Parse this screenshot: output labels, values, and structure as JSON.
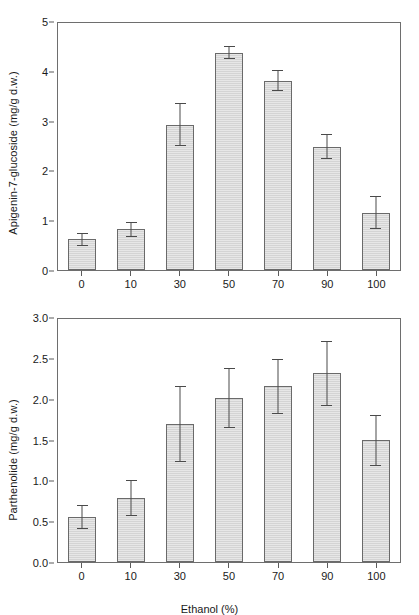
{
  "figure": {
    "background": "#ffffff",
    "bar_fill": "#d4d4d4",
    "bar_edge": "#6a6a6a",
    "axis_color": "#6e6e6e",
    "error_color": "#4a4a4a"
  },
  "chart_data": [
    {
      "type": "bar",
      "panel": "top",
      "title": "",
      "xlabel": "",
      "ylabel": "Apigenin-7-glucoside (mg/g d.w.)",
      "categories": [
        "0",
        "10",
        "30",
        "50",
        "70",
        "90",
        "100"
      ],
      "values": [
        0.62,
        0.82,
        2.92,
        4.36,
        3.8,
        2.48,
        1.15
      ],
      "errors": [
        0.13,
        0.15,
        0.43,
        0.13,
        0.21,
        0.25,
        0.33
      ],
      "ylim": [
        0,
        5
      ],
      "ytick_labels": [
        "0",
        "1",
        "2",
        "3",
        "4",
        "5"
      ],
      "ytick_values": [
        0,
        1,
        2,
        3,
        4,
        5
      ],
      "grid": false,
      "legend": "none",
      "error_type": "error bars"
    },
    {
      "type": "bar",
      "panel": "bottom",
      "title": "",
      "xlabel": "Ethanol (%)",
      "ylabel": "Parthenolide (mg/g d.w.)",
      "categories": [
        "0",
        "10",
        "30",
        "50",
        "70",
        "90",
        "100"
      ],
      "values": [
        0.55,
        0.78,
        1.69,
        2.01,
        2.15,
        2.31,
        1.49
      ],
      "errors": [
        0.15,
        0.22,
        0.47,
        0.37,
        0.34,
        0.4,
        0.31
      ],
      "ylim": [
        0,
        3
      ],
      "ytick_labels": [
        "0.0",
        "0.5",
        "1.0",
        "1.5",
        "2.0",
        "2.5",
        "3.0"
      ],
      "ytick_values": [
        0,
        0.5,
        1,
        1.5,
        2,
        2.5,
        3
      ],
      "grid": false,
      "legend": "none",
      "error_type": "error bars"
    }
  ]
}
